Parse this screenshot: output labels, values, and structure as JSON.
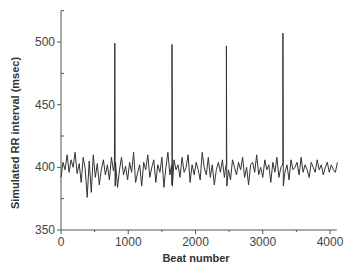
{
  "chart_data": {
    "type": "line",
    "title": "",
    "xlabel": "Beat number",
    "ylabel": "Simulated RR interval (msec)",
    "xlim": [
      0,
      4100
    ],
    "ylim": [
      350,
      525
    ],
    "xticks": [
      0,
      1000,
      2000,
      3000,
      4000
    ],
    "yticks": [
      350,
      400,
      450,
      500
    ],
    "grid": false,
    "legend": null,
    "line_color": "#333333",
    "series": [
      {
        "name": "RR interval",
        "step": 30,
        "x_start": 0,
        "values": [
          392,
          404,
          398,
          410,
          396,
          406,
          400,
          412,
          395,
          403,
          388,
          408,
          399,
          376,
          405,
          380,
          410,
          392,
          403,
          386,
          398,
          406,
          394,
          402,
          390,
          408,
          397,
          404,
          384,
          398,
          408,
          394,
          401,
          390,
          404,
          396,
          412,
          388,
          396,
          402,
          385,
          404,
          398,
          410,
          392,
          400,
          406,
          388,
          402,
          396,
          408,
          384,
          400,
          412,
          394,
          386,
          406,
          398,
          402,
          392,
          408,
          396,
          400,
          410,
          388,
          402,
          394,
          404,
          398,
          390,
          412,
          400,
          394,
          408,
          392,
          402,
          386,
          398,
          404,
          396,
          406,
          392,
          402,
          398,
          390,
          406,
          400,
          394,
          404,
          398,
          408,
          392,
          400,
          386,
          402,
          404,
          396,
          410,
          394,
          400,
          392,
          406,
          398,
          402,
          388,
          404,
          396,
          408,
          392,
          400,
          404,
          396,
          402,
          390,
          406,
          398,
          400,
          404,
          394,
          408,
          396,
          402,
          398,
          392,
          404,
          400,
          396,
          406,
          398,
          402,
          394,
          400,
          404,
          396,
          402,
          398,
          396,
          404
        ]
      }
    ],
    "spikes": [
      {
        "x": 800,
        "y": 499
      },
      {
        "x": 1650,
        "y": 498
      },
      {
        "x": 2460,
        "y": 497
      },
      {
        "x": 3300,
        "y": 507
      }
    ]
  }
}
